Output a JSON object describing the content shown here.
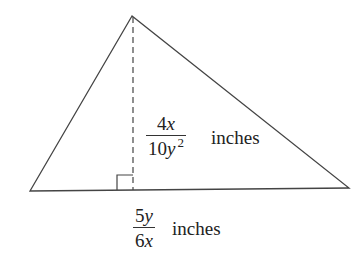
{
  "figure": {
    "shape": "triangle",
    "vertices": {
      "apex": [
        132,
        16
      ],
      "left_base": [
        30,
        191
      ],
      "right_base": [
        349,
        188
      ]
    },
    "height_label": {
      "numerator": {
        "coef": "4",
        "var": "x"
      },
      "denominator": {
        "coef": "10",
        "var": "y",
        "exp": "2"
      },
      "unit": "inches"
    },
    "base_label": {
      "numerator": {
        "coef": "5",
        "var": "y"
      },
      "denominator": {
        "coef": "6",
        "var": "x"
      },
      "unit": "inches"
    },
    "line_color": "#333333"
  }
}
